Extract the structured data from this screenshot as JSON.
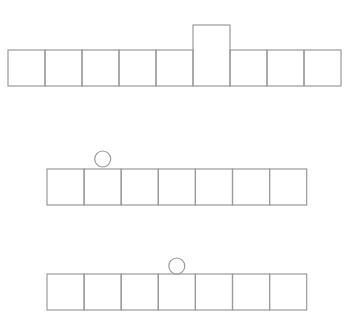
{
  "diagram": {
    "stroke_color": "#9a9a9a",
    "background": "#ffffff",
    "rows": [
      {
        "name": "row-1",
        "cell_count": 9,
        "x": 8,
        "y": 50,
        "cell_w": 37,
        "cell_h": 36,
        "raised_cell_index": 5,
        "raised_top_y": 25,
        "circle": null
      },
      {
        "name": "row-2",
        "cell_count": 7,
        "x": 47,
        "y": 169,
        "cell_w": 37.1,
        "cell_h": 36,
        "raised_cell_index": null,
        "circle": {
          "over_cell_index": 1,
          "cy": 159,
          "r": 8
        }
      },
      {
        "name": "row-3",
        "cell_count": 7,
        "x": 47,
        "y": 274,
        "cell_w": 37.1,
        "cell_h": 36,
        "raised_cell_index": null,
        "circle": {
          "over_cell_index": 3,
          "cy": 266,
          "r": 8
        }
      }
    ]
  }
}
